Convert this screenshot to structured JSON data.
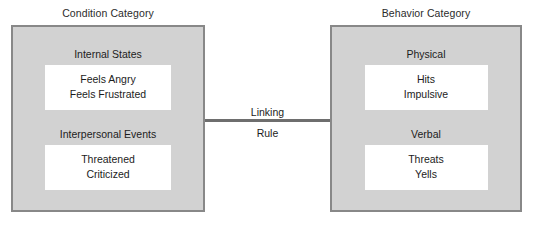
{
  "diagram": {
    "title_left": "Condition Category",
    "title_right": "Behavior Category",
    "connector": {
      "label_top": "Linking",
      "label_bottom": "Rule"
    },
    "colors": {
      "panel_fill": "#d2d2d2",
      "panel_border": "#888888",
      "item_fill": "#ffffff",
      "connector": "#6e6e6e",
      "text": "#1c1c1c",
      "background": "#ffffff"
    },
    "left_panel": {
      "groups": [
        {
          "heading": "Internal States",
          "items": [
            "Feels Angry",
            "Feels Frustrated"
          ]
        },
        {
          "heading": "Interpersonal Events",
          "items": [
            "Threatened",
            "Criticized"
          ]
        }
      ]
    },
    "right_panel": {
      "groups": [
        {
          "heading": "Physical",
          "items": [
            "Hits",
            "Impulsive"
          ]
        },
        {
          "heading": "Verbal",
          "items": [
            "Threats",
            "Yells"
          ]
        }
      ]
    }
  }
}
